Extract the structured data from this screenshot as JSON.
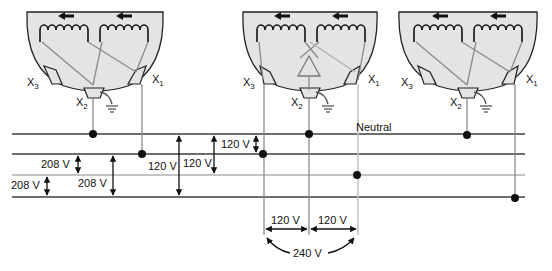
{
  "diagram": {
    "colors": {
      "bus_dark": "#6e6e6e",
      "bus_light": "#c4c4c4",
      "dome_fill": "#e4e4e4",
      "ink": "#111111"
    },
    "transformers": [
      {
        "id": "left",
        "terminals": {
          "x3": "X",
          "x3_sub": "3",
          "x2": "X",
          "x2_sub": "2",
          "x1": "X",
          "x1_sub": "1"
        },
        "has_center_tap_symbol": false
      },
      {
        "id": "center",
        "terminals": {
          "x3": "X",
          "x3_sub": "3",
          "x2": "X",
          "x2_sub": "2",
          "x1": "X",
          "x1_sub": "1"
        },
        "has_center_tap_symbol": true
      },
      {
        "id": "right",
        "terminals": {
          "x3": "X",
          "x3_sub": "3",
          "x2": "X",
          "x2_sub": "2",
          "x1": "X",
          "x1_sub": "1"
        },
        "has_center_tap_symbol": false
      }
    ],
    "buses": [
      {
        "id": "bus-1",
        "label": "Neutral",
        "shade": "dark"
      },
      {
        "id": "bus-2",
        "label": "",
        "shade": "dark"
      },
      {
        "id": "bus-3",
        "label": "",
        "shade": "light"
      },
      {
        "id": "bus-4",
        "label": "",
        "shade": "dark"
      }
    ],
    "voltage_labels": {
      "v208_a": "208 V",
      "v208_b": "208 V",
      "v208_c": "208 V",
      "v120_a": "120 V",
      "v120_b": "120 V",
      "v120_c": "120 V",
      "v120_left": "120 V",
      "v120_right": "120 V",
      "v240": "240 V"
    }
  }
}
